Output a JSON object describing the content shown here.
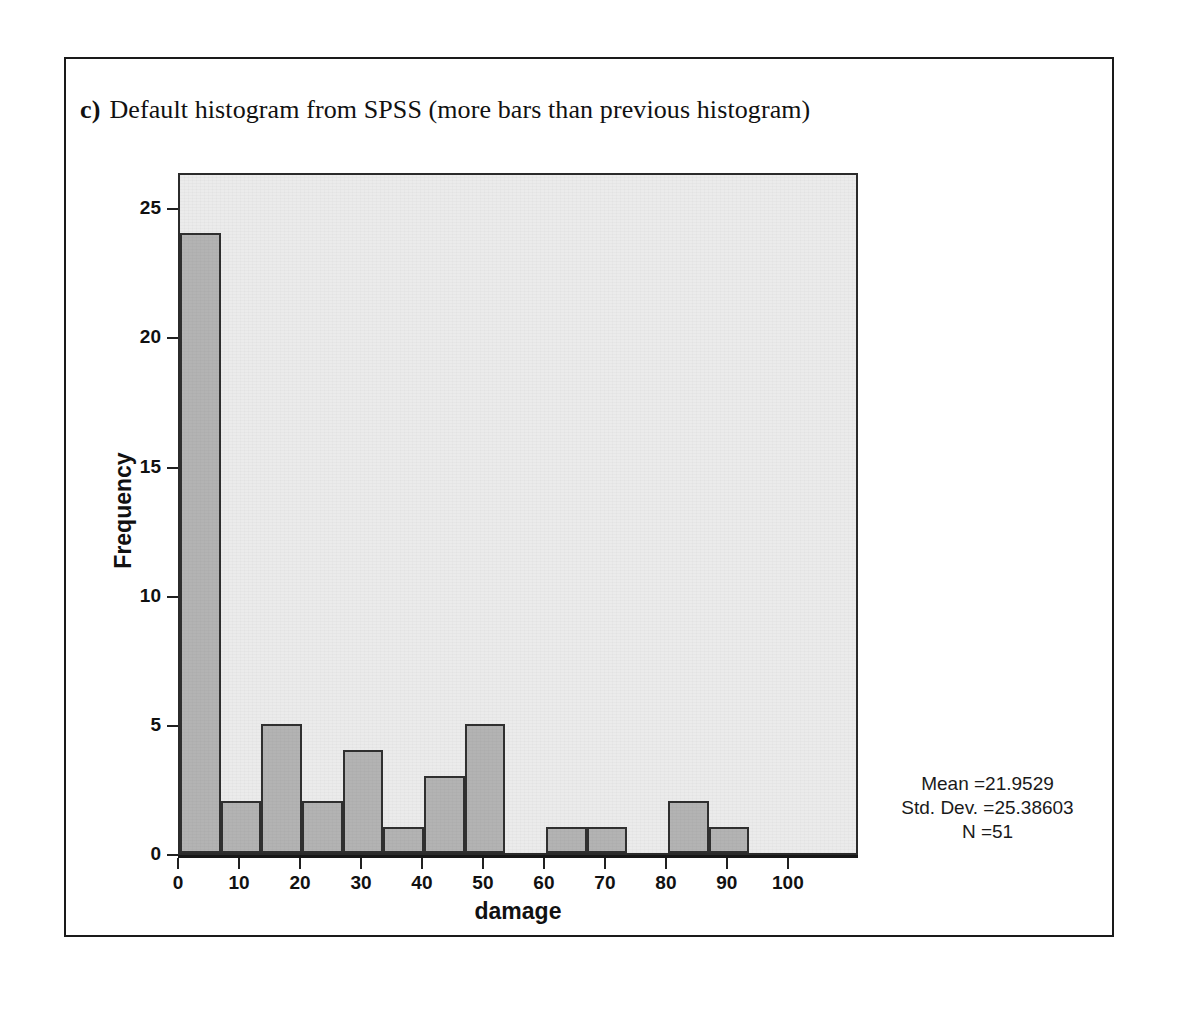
{
  "caption": {
    "label": "c)",
    "text": "Default histogram from SPSS (more bars than previous histogram)"
  },
  "chart_data": {
    "type": "bar",
    "title": "",
    "xlabel": "damage",
    "ylabel": "Frequency",
    "xlim": [
      0,
      111.5
    ],
    "ylim": [
      0,
      26.4
    ],
    "xticks": [
      "0",
      "10",
      "20",
      "30",
      "40",
      "50",
      "60",
      "70",
      "80",
      "90",
      "100"
    ],
    "xtick_values": [
      0,
      10,
      20,
      30,
      40,
      50,
      60,
      70,
      80,
      90,
      100
    ],
    "yticks": [
      "0",
      "5",
      "10",
      "15",
      "20",
      "25"
    ],
    "ytick_values": [
      0,
      5,
      10,
      15,
      20,
      25
    ],
    "grid": false,
    "legend": "none",
    "bin_width": 6.67,
    "categories": [
      "0-6.7",
      "6.7-13.3",
      "13.3-20",
      "20-26.7",
      "26.7-33.3",
      "33.3-40",
      "40-46.7",
      "46.7-53.3",
      "53.3-60",
      "60-66.7",
      "66.7-73.3",
      "73.3-80",
      "80-86.7",
      "86.7-93.3"
    ],
    "bin_starts": [
      0,
      6.67,
      13.33,
      20,
      26.67,
      33.33,
      40,
      46.67,
      53.33,
      60,
      66.67,
      73.33,
      80,
      86.67
    ],
    "values": [
      24,
      2,
      5,
      2,
      4,
      1,
      3,
      5,
      0,
      1,
      1,
      0,
      2,
      1
    ],
    "annotations": {
      "mean_label": "Mean =21.9529",
      "std_label": "Std. Dev. =25.38603",
      "n_label": "N =51",
      "mean": 21.9529,
      "std_dev": 25.38603,
      "n": 51
    },
    "colors": {
      "bar_fill": "#b3b3b3",
      "bar_border": "#303030",
      "plot_background": "#ebebeb",
      "axis": "#202020",
      "text": "#111111"
    }
  }
}
